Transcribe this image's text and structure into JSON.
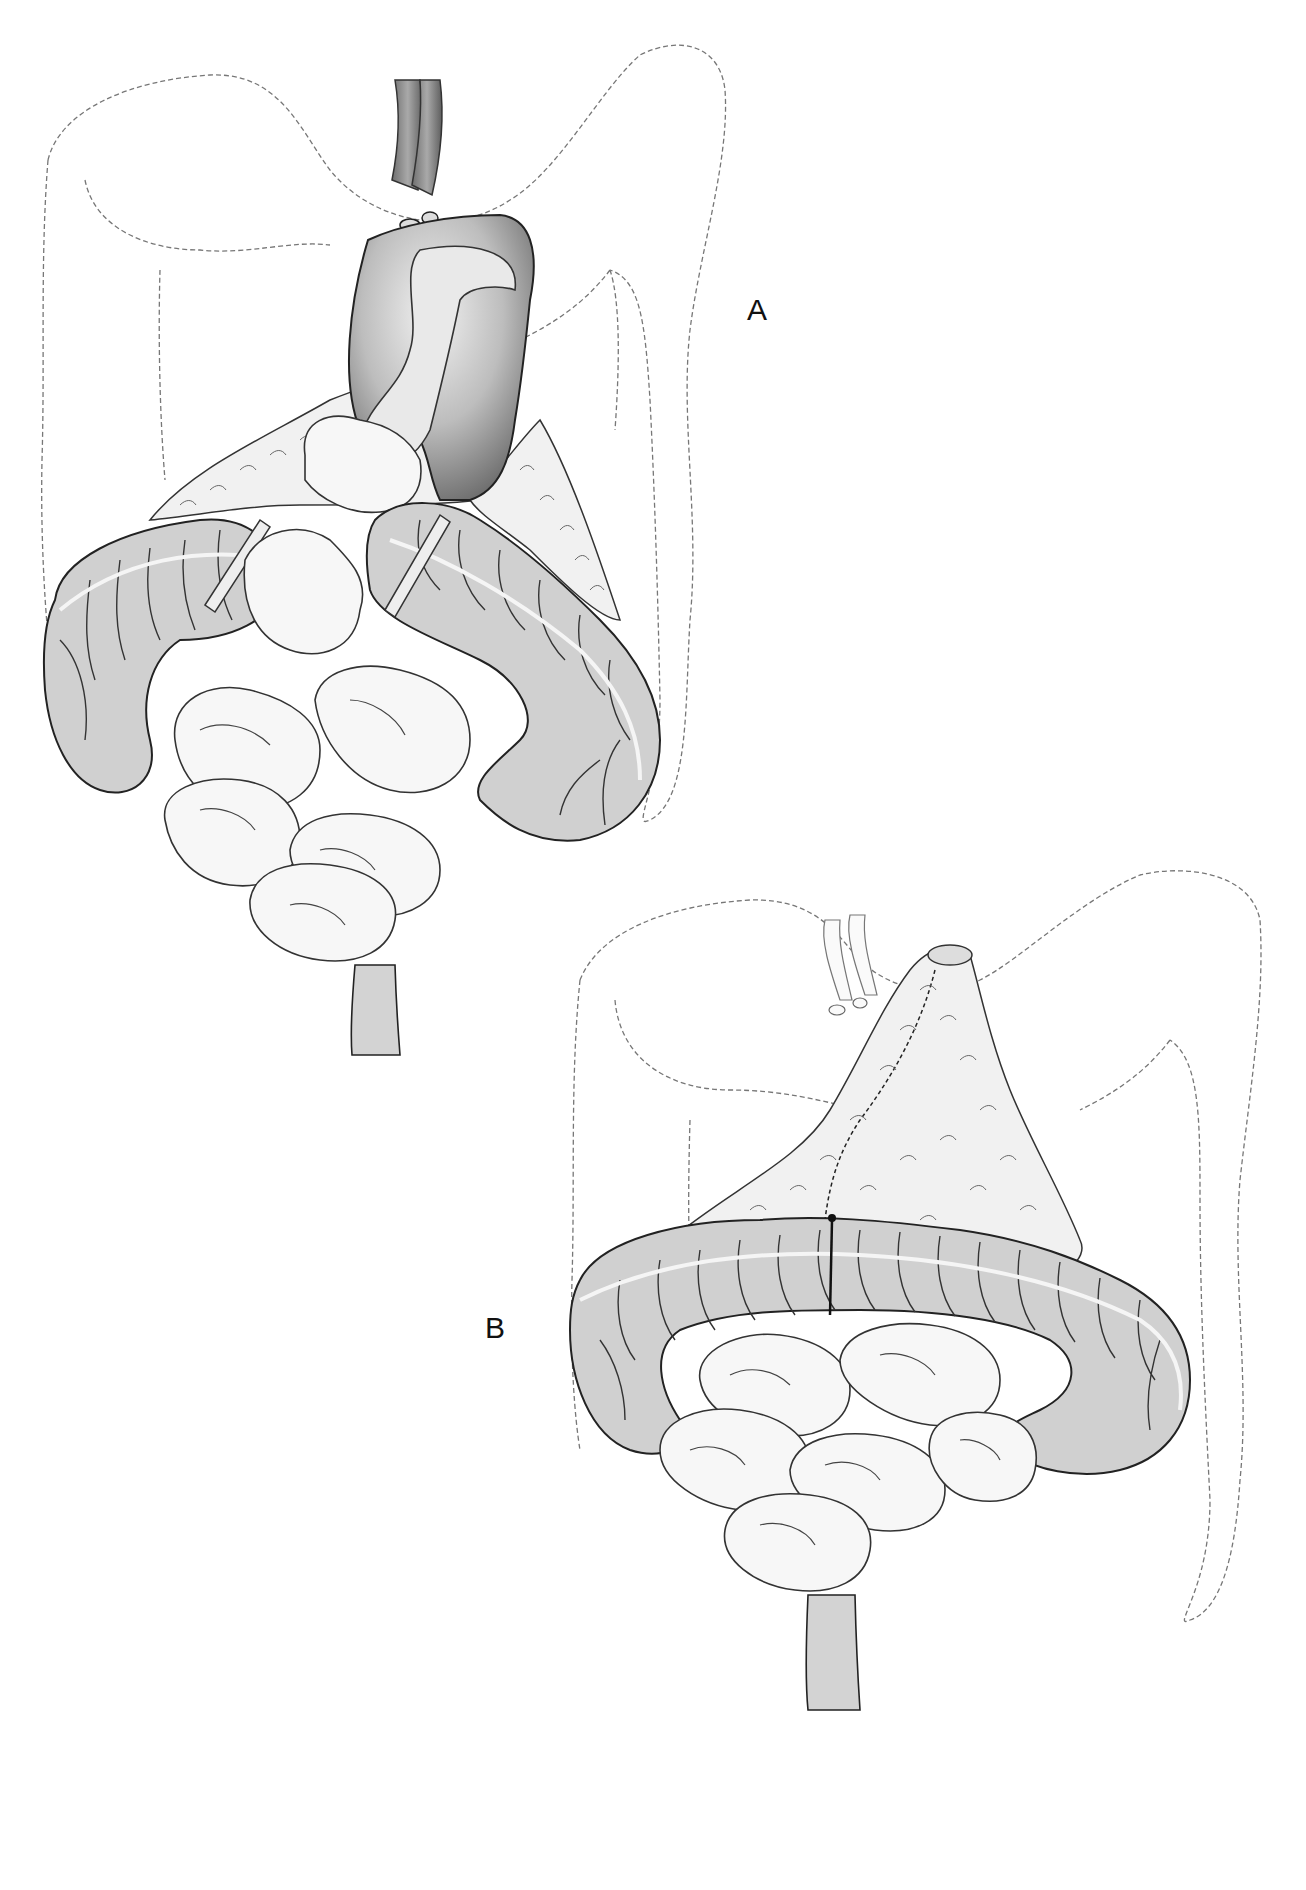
{
  "figure": {
    "panels": [
      {
        "id": "A",
        "label": "A",
        "description": "Opened stomach with duodenum and loops of small bowel; transverse colon divided with clamps; omentum partially mobilized"
      },
      {
        "id": "B",
        "label": "B",
        "description": "Omentum formed into a cone/flap sutured along its length; transverse colon reconstructed; vessels retracted above"
      }
    ]
  },
  "colors": {
    "background": "#ffffff",
    "colon_fill": "#d0d0d0",
    "small_bowel_fill": "#f7f7f7",
    "outline_dashed": "#777777",
    "stroke": "#222222"
  }
}
